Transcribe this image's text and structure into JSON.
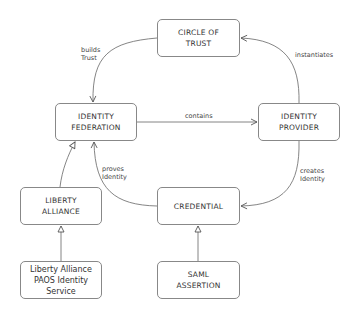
{
  "diagram": {
    "type": "concept-map",
    "nodes": [
      {
        "id": "circle_of_trust",
        "lines": [
          "Circle Of",
          "Trust"
        ],
        "style": "small-caps"
      },
      {
        "id": "identity_federation",
        "lines": [
          "Identity",
          "Federation"
        ],
        "style": "small-caps"
      },
      {
        "id": "identity_provider",
        "lines": [
          "Identity",
          "Provider"
        ],
        "style": "small-caps"
      },
      {
        "id": "liberty_alliance",
        "lines": [
          "Liberty",
          "Alliance"
        ],
        "style": "small-caps"
      },
      {
        "id": "credential",
        "lines": [
          "Credential"
        ],
        "style": "small-caps"
      },
      {
        "id": "liberty_paos",
        "lines": [
          "Liberty Alliance",
          "PAOS Identity Service"
        ],
        "style": "plain"
      },
      {
        "id": "saml_assertion",
        "lines": [
          "SAML",
          "Assertion"
        ],
        "style": "small-caps"
      }
    ],
    "edges": [
      {
        "from": "circle_of_trust",
        "to": "identity_federation",
        "label": [
          "builds",
          "Trust"
        ],
        "kind": "association"
      },
      {
        "from": "identity_federation",
        "to": "identity_provider",
        "label": [
          "contains"
        ],
        "kind": "association"
      },
      {
        "from": "identity_provider",
        "to": "circle_of_trust",
        "label": [
          "instantiates"
        ],
        "kind": "association"
      },
      {
        "from": "identity_provider",
        "to": "credential",
        "label": [
          "creates",
          "Identity"
        ],
        "kind": "association"
      },
      {
        "from": "credential",
        "to": "identity_federation",
        "label": [
          "proves",
          "Identity"
        ],
        "kind": "association"
      },
      {
        "from": "liberty_alliance",
        "to": "identity_federation",
        "label": [],
        "kind": "generalization"
      },
      {
        "from": "liberty_paos",
        "to": "liberty_alliance",
        "label": [],
        "kind": "generalization"
      },
      {
        "from": "saml_assertion",
        "to": "credential",
        "label": [],
        "kind": "generalization"
      }
    ]
  }
}
